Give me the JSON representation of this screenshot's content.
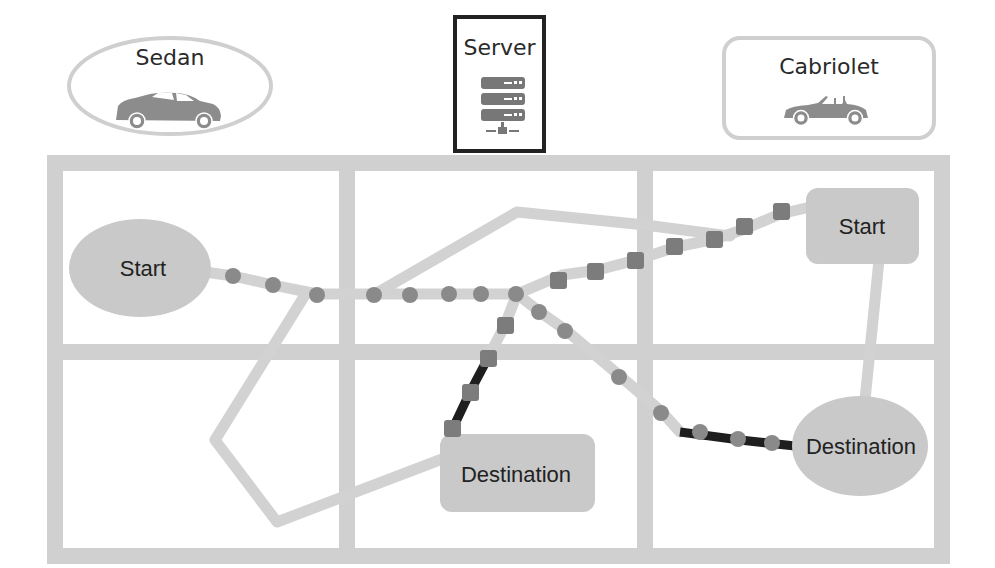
{
  "colors": {
    "grid": "#d0d0d0",
    "road": "#d2d2d2",
    "node_fill": "#c9c9c9",
    "marker": "#8a8a8a",
    "active_path": "#1e1e1e",
    "server_border": "#222222",
    "car": "#8c8c8c",
    "legend_border": "#cccccc"
  },
  "legend": {
    "sedan": {
      "label": "Sedan",
      "shape": "ellipse",
      "icon": "sedan-car-icon",
      "marker_shape": "circle"
    },
    "server": {
      "label": "Server",
      "icon": "server-rack-icon"
    },
    "cabriolet": {
      "label": "Cabriolet",
      "shape": "rounded-rectangle",
      "icon": "cabriolet-car-icon",
      "marker_shape": "square"
    }
  },
  "map": {
    "grid": {
      "columns": 3,
      "rows": 2
    },
    "nodes": [
      {
        "id": "sedan-start",
        "label": "Start",
        "shape": "ellipse"
      },
      {
        "id": "cabriolet-start",
        "label": "Start",
        "shape": "rounded-rectangle"
      },
      {
        "id": "cabriolet-destination",
        "label": "Destination",
        "shape": "rounded-rectangle"
      },
      {
        "id": "sedan-destination",
        "label": "Destination",
        "shape": "ellipse"
      }
    ],
    "routes": [
      {
        "vehicle": "sedan",
        "from": "Start",
        "to": "Destination",
        "marker": "circle",
        "marker_count": 15
      },
      {
        "vehicle": "cabriolet",
        "from": "Start",
        "to": "Destination",
        "marker": "square",
        "marker_count": 12
      }
    ]
  }
}
